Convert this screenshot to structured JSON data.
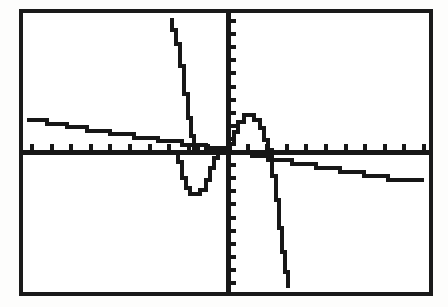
{
  "device": {
    "kind": "graphing-calculator-screen",
    "screen_label": "LCD graph window",
    "bezel_color": "#1a1a1a",
    "screen_color": "#ffffff",
    "ink_color": "#171717",
    "page_background": "#fdfdfc"
  },
  "chart_data": {
    "type": "line",
    "title": "",
    "subtitle": "",
    "xlabel": "",
    "ylabel": "",
    "grid": false,
    "legend_position": "none",
    "axes": {
      "x_axis_visible": true,
      "y_axis_visible": true,
      "origin_px": {
        "x": 228,
        "y": 152
      },
      "xlim": [
        -10,
        10
      ],
      "ylim": [
        -10,
        10
      ],
      "x_tick_interval": 1,
      "y_tick_interval": 1,
      "x_tick_count": 21,
      "y_tick_count": 21,
      "x_tick_direction": "up",
      "y_tick_direction": "right",
      "x_tick_length_px": 6,
      "y_tick_length_px": 6,
      "tick_labels_shown": false,
      "x_tick_labels": [],
      "y_tick_labels": []
    },
    "render_style": {
      "pixelated_steps": true,
      "stroke_width_px": 4,
      "note": "low-resolution LCD stair-stepped plot"
    },
    "series": [
      {
        "name": "series-descending-line",
        "description": "gently descending near-linear function crossing the x-axis just left of the origin",
        "color": "#171717",
        "points": [
          [
            27,
            120
          ],
          [
            47,
            120
          ],
          [
            47,
            124
          ],
          [
            67,
            124
          ],
          [
            67,
            127
          ],
          [
            87,
            127
          ],
          [
            87,
            131
          ],
          [
            110,
            131
          ],
          [
            110,
            134
          ],
          [
            134,
            134
          ],
          [
            134,
            138
          ],
          [
            158,
            138
          ],
          [
            158,
            141
          ],
          [
            182,
            141
          ],
          [
            182,
            145
          ],
          [
            206,
            145
          ],
          [
            206,
            148
          ],
          [
            228,
            148
          ],
          [
            228,
            152
          ],
          [
            252,
            152
          ],
          [
            252,
            156
          ],
          [
            268,
            156
          ],
          [
            268,
            160
          ],
          [
            292,
            160
          ],
          [
            292,
            164
          ],
          [
            316,
            164
          ],
          [
            316,
            168
          ],
          [
            340,
            168
          ],
          [
            340,
            172
          ],
          [
            364,
            172
          ],
          [
            364,
            176
          ],
          [
            388,
            176
          ],
          [
            388,
            180
          ],
          [
            424,
            180
          ]
        ]
      },
      {
        "name": "series-left-asymptote-branch",
        "description": "steep branch plunging from the top of the window down to the x-axis near x = -2",
        "color": "#171717",
        "points": [
          [
            172,
            18
          ],
          [
            172,
            30
          ],
          [
            176,
            30
          ],
          [
            176,
            44
          ],
          [
            180,
            44
          ],
          [
            180,
            66
          ],
          [
            184,
            66
          ],
          [
            184,
            94
          ],
          [
            188,
            94
          ],
          [
            188,
            118
          ],
          [
            191,
            118
          ],
          [
            191,
            136
          ],
          [
            194,
            136
          ],
          [
            194,
            148
          ],
          [
            198,
            148
          ],
          [
            198,
            152
          ]
        ]
      },
      {
        "name": "series-valley",
        "description": "trough dipping below the x-axis between the left asymptote and the origin",
        "color": "#171717",
        "points": [
          [
            178,
            152
          ],
          [
            178,
            162
          ],
          [
            182,
            162
          ],
          [
            182,
            178
          ],
          [
            186,
            178
          ],
          [
            186,
            188
          ],
          [
            190,
            188
          ],
          [
            190,
            194
          ],
          [
            200,
            194
          ],
          [
            200,
            190
          ],
          [
            206,
            190
          ],
          [
            206,
            180
          ],
          [
            210,
            180
          ],
          [
            210,
            168
          ],
          [
            214,
            168
          ],
          [
            214,
            158
          ],
          [
            218,
            158
          ],
          [
            218,
            152
          ]
        ]
      },
      {
        "name": "series-bump",
        "description": "small hump rising above the x-axis just right of the y-axis",
        "color": "#171717",
        "points": [
          [
            230,
            152
          ],
          [
            230,
            144
          ],
          [
            234,
            144
          ],
          [
            234,
            132
          ],
          [
            238,
            132
          ],
          [
            238,
            122
          ],
          [
            244,
            122
          ],
          [
            244,
            115
          ],
          [
            254,
            115
          ],
          [
            254,
            120
          ],
          [
            260,
            120
          ],
          [
            260,
            128
          ],
          [
            264,
            128
          ],
          [
            264,
            140
          ],
          [
            268,
            140
          ],
          [
            268,
            150
          ],
          [
            272,
            150
          ],
          [
            272,
            156
          ]
        ]
      },
      {
        "name": "series-right-asymptote-branch",
        "description": "steep branch falling from the x-axis down past the bottom of the window near x = 1.8",
        "color": "#171717",
        "points": [
          [
            272,
            156
          ],
          [
            272,
            176
          ],
          [
            276,
            176
          ],
          [
            276,
            200
          ],
          [
            279,
            200
          ],
          [
            279,
            228
          ],
          [
            282,
            228
          ],
          [
            282,
            252
          ],
          [
            285,
            252
          ],
          [
            285,
            272
          ],
          [
            288,
            272
          ],
          [
            288,
            288
          ]
        ]
      }
    ]
  },
  "accessibility": {
    "summary": "Graphing calculator LCD display showing a rational function with two vertical asymptotes and a shallow descending line, drawn with stair-stepped pixel segments."
  }
}
